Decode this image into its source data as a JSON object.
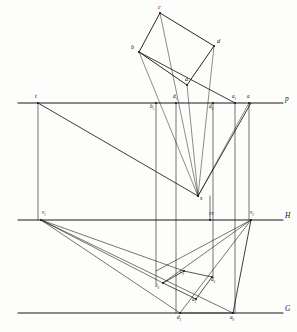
{
  "figure": {
    "kind": "descriptive-geometry-perspective-construction",
    "background": "#fdfdfb",
    "ink": "#1a1a1a"
  },
  "reference_lines": [
    {
      "id": "P",
      "label": "p",
      "name": "picture-plane-line",
      "y": 103,
      "x1": 18,
      "x2": 283,
      "label_x": 285,
      "label_y": 95
    },
    {
      "id": "H",
      "label": "H",
      "name": "horizon-line",
      "y": 220,
      "x1": 18,
      "x2": 283,
      "label_x": 285,
      "label_y": 212
    },
    {
      "id": "G",
      "label": "G",
      "name": "ground-line",
      "y": 313,
      "x1": 18,
      "x2": 283,
      "label_x": 285,
      "label_y": 305
    }
  ],
  "points": [
    {
      "id": "c",
      "label": "c",
      "x": 160,
      "y": 13,
      "lx": 158,
      "ly": 4,
      "size": "s6"
    },
    {
      "id": "b",
      "label": "b",
      "x": 139,
      "y": 52,
      "lx": 131,
      "ly": 44,
      "size": "s6"
    },
    {
      "id": "d",
      "label": "d",
      "x": 214,
      "y": 46,
      "lx": 217,
      "ly": 38,
      "size": "s6"
    },
    {
      "id": "a",
      "label": "a",
      "x": 187,
      "y": 85,
      "lx": 185,
      "ly": 76,
      "size": "s6"
    },
    {
      "id": "t",
      "label": "t",
      "x": 38,
      "y": 103,
      "lx": 35,
      "ly": 93,
      "size": "s6"
    },
    {
      "id": "b1",
      "label": "b",
      "sub": "1",
      "x": 156,
      "y": 103,
      "lx": 150,
      "ly": 104,
      "size": "s5"
    },
    {
      "id": "d1",
      "label": "d",
      "sub": "1",
      "x": 176,
      "y": 103,
      "lx": 173,
      "ly": 94,
      "size": "s5"
    },
    {
      "id": "d0",
      "label": "d",
      "sub": "0",
      "x": 213,
      "y": 103,
      "lx": 209,
      "ly": 104,
      "size": "s5"
    },
    {
      "id": "a1",
      "label": "a",
      "sub": "1",
      "x": 235,
      "y": 103,
      "lx": 232,
      "ly": 94,
      "size": "s5"
    },
    {
      "id": "a",
      "label": "a",
      "x": 249,
      "y": 103,
      "lx": 247,
      "ly": 94,
      "size": "s5"
    },
    {
      "id": "s",
      "label": "s",
      "x": 198,
      "y": 196,
      "lx": 200,
      "ly": 195,
      "size": "s6"
    },
    {
      "id": "v1",
      "label": "v",
      "sub": "1",
      "x": 41,
      "y": 220,
      "lx": 42,
      "ly": 210,
      "size": "s5"
    },
    {
      "id": "cv",
      "label": "cv",
      "x": 210,
      "y": 220,
      "lx": 209,
      "ly": 211,
      "size": "s5"
    },
    {
      "id": "v2",
      "label": "v",
      "sub": "2",
      "x": 251,
      "y": 220,
      "lx": 250,
      "ly": 210,
      "size": "s5"
    },
    {
      "id": "b0",
      "label": "b",
      "sub": "0",
      "x": 163,
      "y": 283,
      "lx": 155,
      "ly": 283,
      "size": "s5"
    },
    {
      "id": "c0",
      "label": "c",
      "sub": "0",
      "x": 184,
      "y": 271,
      "lx": 180,
      "ly": 269,
      "size": "s5"
    },
    {
      "id": "d00",
      "label": "d",
      "sub": "0",
      "x": 212,
      "y": 277,
      "lx": 211,
      "ly": 277,
      "size": "s5"
    },
    {
      "id": "a2",
      "label": "a",
      "sub": "2",
      "x": 196,
      "y": 299,
      "lx": 192,
      "ly": 297,
      "size": "s5"
    },
    {
      "id": "d1g",
      "label": "d",
      "sub": "1",
      "x": 180,
      "y": 313,
      "lx": 177,
      "ly": 315,
      "size": "s5"
    },
    {
      "id": "a0",
      "label": "a",
      "sub": "0",
      "x": 233,
      "y": 313,
      "lx": 230,
      "ly": 315,
      "size": "s5"
    }
  ],
  "rectangle": {
    "name": "object-plan-rectangle",
    "vertices": [
      [
        139,
        52
      ],
      [
        160,
        13
      ],
      [
        214,
        46
      ],
      [
        187,
        85
      ]
    ]
  },
  "segments": [
    {
      "name": "diagonal-b-to-a1",
      "x1": 139,
      "y1": 52,
      "x2": 235,
      "y2": 103,
      "w": 0.85
    },
    {
      "name": "ray-b-to-s",
      "x1": 139,
      "y1": 52,
      "x2": 198,
      "y2": 196,
      "w": 0.5
    },
    {
      "name": "ray-c-to-s",
      "x1": 160,
      "y1": 13,
      "x2": 198,
      "y2": 196,
      "w": 0.5
    },
    {
      "name": "ray-d-to-s",
      "x1": 214,
      "y1": 46,
      "x2": 198,
      "y2": 196,
      "w": 0.5
    },
    {
      "name": "ray-a-to-s",
      "x1": 187,
      "y1": 85,
      "x2": 198,
      "y2": 196,
      "w": 0.5
    },
    {
      "name": "ray-t-to-s",
      "x1": 38,
      "y1": 103,
      "x2": 198,
      "y2": 196,
      "w": 0.85
    },
    {
      "name": "ray-s-to-v2-up",
      "x1": 198,
      "y1": 196,
      "x2": 251,
      "y2": 103,
      "w": 0.85
    },
    {
      "name": "ray-s-to-a-topline",
      "x1": 198,
      "y1": 196,
      "x2": 249,
      "y2": 103,
      "w": 0.5
    },
    {
      "name": "vert-t",
      "x1": 38,
      "y1": 103,
      "x2": 38,
      "y2": 220,
      "w": 0.6
    },
    {
      "name": "vert-b1",
      "x1": 156,
      "y1": 103,
      "x2": 156,
      "y2": 283,
      "w": 0.6
    },
    {
      "name": "vert-d1",
      "x1": 176,
      "y1": 103,
      "x2": 176,
      "y2": 313,
      "w": 0.6
    },
    {
      "name": "vert-d0",
      "x1": 213,
      "y1": 103,
      "x2": 213,
      "y2": 277,
      "w": 0.6
    },
    {
      "name": "vert-a1",
      "x1": 235,
      "y1": 103,
      "x2": 235,
      "y2": 313,
      "w": 0.6
    },
    {
      "name": "vert-a",
      "x1": 249,
      "y1": 103,
      "x2": 249,
      "y2": 220,
      "w": 0.6
    },
    {
      "name": "vert-cv",
      "x1": 210,
      "y1": 196,
      "x2": 210,
      "y2": 220,
      "w": 0.6
    },
    {
      "name": "perspective-v1-to-b0",
      "x1": 41,
      "y1": 220,
      "x2": 163,
      "y2": 283,
      "w": 0.6
    },
    {
      "name": "perspective-v1-to-c0",
      "x1": 41,
      "y1": 220,
      "x2": 184,
      "y2": 271,
      "w": 0.6
    },
    {
      "name": "perspective-v1-to-d1g",
      "x1": 41,
      "y1": 220,
      "x2": 180,
      "y2": 313,
      "w": 0.6
    },
    {
      "name": "perspective-v1-to-a2",
      "x1": 41,
      "y1": 220,
      "x2": 233,
      "y2": 313,
      "w": 0.6
    },
    {
      "name": "perspective-v2-to-b0",
      "x1": 251,
      "y1": 220,
      "x2": 163,
      "y2": 283,
      "w": 0.6
    },
    {
      "name": "perspective-v2-to-c0ext",
      "x1": 251,
      "y1": 220,
      "x2": 156,
      "y2": 271,
      "w": 0.6
    },
    {
      "name": "perspective-v2-to-d1g",
      "x1": 251,
      "y1": 220,
      "x2": 180,
      "y2": 313,
      "w": 0.6
    },
    {
      "name": "edge-b0-c0",
      "x1": 163,
      "y1": 283,
      "x2": 184,
      "y2": 271,
      "w": 0.75
    },
    {
      "name": "edge-c0-d00",
      "x1": 184,
      "y1": 271,
      "x2": 212,
      "y2": 277,
      "w": 0.75
    },
    {
      "name": "edge-d00-a2",
      "x1": 212,
      "y1": 277,
      "x2": 196,
      "y2": 299,
      "w": 0.75
    },
    {
      "name": "edge-a2-b0",
      "x1": 196,
      "y1": 299,
      "x2": 163,
      "y2": 283,
      "w": 0.75
    },
    {
      "name": "edge-a0-up-v2",
      "x1": 233,
      "y1": 313,
      "x2": 251,
      "y2": 220,
      "w": 0.85
    },
    {
      "name": "edge-d1g-to-a0",
      "x1": 180,
      "y1": 313,
      "x2": 233,
      "y2": 313,
      "w": 0.6
    }
  ],
  "title": ""
}
